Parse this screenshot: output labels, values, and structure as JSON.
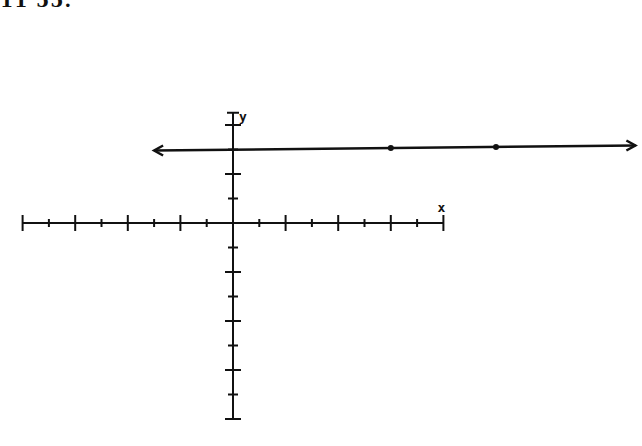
{
  "header": {
    "cut_off_text": "11 55."
  },
  "chart_data": {
    "type": "line",
    "title": "",
    "xlabel": "x",
    "ylabel": "y",
    "xlim": [
      -8,
      8
    ],
    "ylim": [
      -8,
      3
    ],
    "grid": false,
    "tick_spacing": 1,
    "major_tick_every": 2,
    "series": [
      {
        "name": "horizontal line y = 3",
        "equation": "y = 3",
        "points": [
          [
            6,
            3
          ],
          [
            10,
            3
          ]
        ],
        "arrows": "both",
        "x_extent": [
          -3,
          15.3
        ]
      }
    ]
  },
  "colors": {
    "ink": "#111111",
    "background": "#ffffff"
  }
}
